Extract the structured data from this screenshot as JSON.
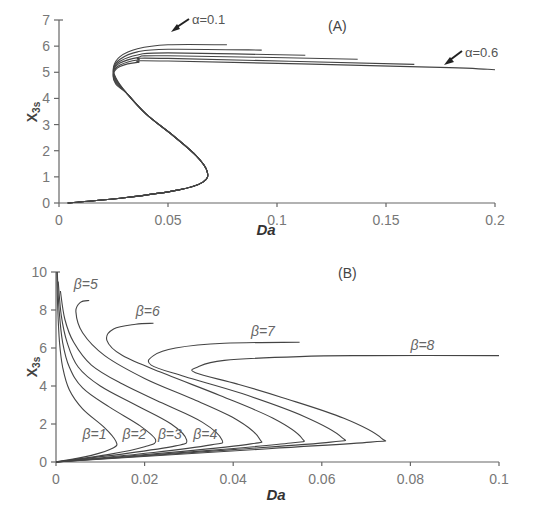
{
  "chart_data": [
    {
      "panel": "(A)",
      "type": "line",
      "title": "",
      "xlabel": "Da",
      "ylabel": "X3s",
      "xlim": [
        0,
        0.2
      ],
      "ylim": [
        0,
        7
      ],
      "xticks": [
        "0",
        "0.05",
        "0.1",
        "0.15",
        "0.2"
      ],
      "yticks": [
        "0",
        "1",
        "2",
        "3",
        "4",
        "5",
        "6",
        "7"
      ],
      "grid": false,
      "annotations": [
        {
          "text": "α=0.1",
          "x": 0.052,
          "y": 6.1
        },
        {
          "text": "α=0.6",
          "x": 0.17,
          "y": 5.2
        }
      ],
      "series": [
        {
          "name": "α=0.1",
          "points": [
            [
              0.004,
              0.0
            ],
            [
              0.03,
              0.2
            ],
            [
              0.055,
              0.5
            ],
            [
              0.066,
              0.8
            ],
            [
              0.068,
              1.2
            ],
            [
              0.063,
              1.8
            ],
            [
              0.052,
              2.6
            ],
            [
              0.04,
              3.4
            ],
            [
              0.031,
              4.2
            ],
            [
              0.026,
              4.8
            ],
            [
              0.025,
              5.2
            ],
            [
              0.028,
              5.6
            ],
            [
              0.036,
              5.9
            ],
            [
              0.05,
              6.05
            ],
            [
              0.077,
              6.05
            ]
          ]
        },
        {
          "name": "α=0.2",
          "points": [
            [
              0.004,
              0.0
            ],
            [
              0.03,
              0.2
            ],
            [
              0.055,
              0.5
            ],
            [
              0.066,
              0.8
            ],
            [
              0.068,
              1.2
            ],
            [
              0.063,
              1.8
            ],
            [
              0.052,
              2.6
            ],
            [
              0.04,
              3.4
            ],
            [
              0.031,
              4.2
            ],
            [
              0.026,
              4.75
            ],
            [
              0.025,
              5.15
            ],
            [
              0.028,
              5.5
            ],
            [
              0.036,
              5.78
            ],
            [
              0.05,
              5.88
            ],
            [
              0.093,
              5.85
            ]
          ]
        },
        {
          "name": "α=0.3",
          "points": [
            [
              0.004,
              0.0
            ],
            [
              0.03,
              0.2
            ],
            [
              0.055,
              0.5
            ],
            [
              0.066,
              0.8
            ],
            [
              0.068,
              1.2
            ],
            [
              0.063,
              1.8
            ],
            [
              0.052,
              2.6
            ],
            [
              0.04,
              3.4
            ],
            [
              0.031,
              4.2
            ],
            [
              0.026,
              4.7
            ],
            [
              0.025,
              5.1
            ],
            [
              0.028,
              5.42
            ],
            [
              0.036,
              5.66
            ],
            [
              0.05,
              5.74
            ],
            [
              0.113,
              5.65
            ]
          ]
        },
        {
          "name": "α=0.4",
          "points": [
            [
              0.004,
              0.0
            ],
            [
              0.03,
              0.2
            ],
            [
              0.055,
              0.5
            ],
            [
              0.066,
              0.8
            ],
            [
              0.068,
              1.2
            ],
            [
              0.063,
              1.8
            ],
            [
              0.052,
              2.6
            ],
            [
              0.04,
              3.4
            ],
            [
              0.031,
              4.2
            ],
            [
              0.026,
              4.65
            ],
            [
              0.025,
              5.05
            ],
            [
              0.028,
              5.35
            ],
            [
              0.036,
              5.56
            ],
            [
              0.05,
              5.63
            ],
            [
              0.137,
              5.5
            ]
          ]
        },
        {
          "name": "α=0.5",
          "points": [
            [
              0.004,
              0.0
            ],
            [
              0.03,
              0.2
            ],
            [
              0.055,
              0.5
            ],
            [
              0.066,
              0.8
            ],
            [
              0.068,
              1.2
            ],
            [
              0.063,
              1.8
            ],
            [
              0.052,
              2.6
            ],
            [
              0.04,
              3.4
            ],
            [
              0.031,
              4.2
            ],
            [
              0.026,
              4.6
            ],
            [
              0.025,
              5.0
            ],
            [
              0.028,
              5.28
            ],
            [
              0.036,
              5.47
            ],
            [
              0.05,
              5.53
            ],
            [
              0.163,
              5.3
            ]
          ]
        },
        {
          "name": "α=0.6",
          "points": [
            [
              0.004,
              0.0
            ],
            [
              0.03,
              0.2
            ],
            [
              0.055,
              0.5
            ],
            [
              0.066,
              0.8
            ],
            [
              0.068,
              1.2
            ],
            [
              0.063,
              1.8
            ],
            [
              0.052,
              2.6
            ],
            [
              0.04,
              3.4
            ],
            [
              0.031,
              4.2
            ],
            [
              0.026,
              4.55
            ],
            [
              0.025,
              4.95
            ],
            [
              0.028,
              5.22
            ],
            [
              0.036,
              5.38
            ],
            [
              0.05,
              5.43
            ],
            [
              0.17,
              5.2
            ],
            [
              0.2,
              5.1
            ]
          ]
        }
      ]
    },
    {
      "panel": "(B)",
      "type": "line",
      "title": "",
      "xlabel": "Da",
      "ylabel": "X3s",
      "xlim": [
        0,
        0.1
      ],
      "ylim": [
        0,
        10
      ],
      "xticks": [
        "0",
        "0.02",
        "0.04",
        "0.06",
        "0.08",
        "0.1"
      ],
      "yticks": [
        "0",
        "2",
        "4",
        "6",
        "8",
        "10"
      ],
      "grid": false,
      "series": [
        {
          "name": "β=1",
          "label_pos": [
            0.006,
            1.2
          ],
          "points": [
            [
              0.0,
              0.0
            ],
            [
              0.008,
              0.35
            ],
            [
              0.013,
              0.75
            ],
            [
              0.0135,
              1.1
            ],
            [
              0.011,
              1.8
            ],
            [
              0.006,
              2.8
            ],
            [
              0.003,
              3.8
            ],
            [
              0.0015,
              5.0
            ],
            [
              0.0008,
              6.3
            ],
            [
              0.0004,
              8.0
            ],
            [
              0.0002,
              10.0
            ]
          ]
        },
        {
          "name": "β=2",
          "label_pos": [
            0.015,
            1.2
          ],
          "points": [
            [
              0.0,
              0.0
            ],
            [
              0.012,
              0.4
            ],
            [
              0.02,
              0.8
            ],
            [
              0.0225,
              1.15
            ],
            [
              0.019,
              1.9
            ],
            [
              0.012,
              2.9
            ],
            [
              0.006,
              3.9
            ],
            [
              0.003,
              5.0
            ],
            [
              0.0015,
              6.3
            ],
            [
              0.0007,
              8.0
            ],
            [
              0.0003,
              10.0
            ]
          ]
        },
        {
          "name": "β=3",
          "label_pos": [
            0.023,
            1.2
          ],
          "points": [
            [
              0.0,
              0.0
            ],
            [
              0.016,
              0.45
            ],
            [
              0.027,
              0.85
            ],
            [
              0.0295,
              1.15
            ],
            [
              0.026,
              2.0
            ],
            [
              0.018,
              3.0
            ],
            [
              0.01,
              4.0
            ],
            [
              0.005,
              5.0
            ],
            [
              0.0025,
              6.3
            ],
            [
              0.0012,
              7.7
            ],
            [
              0.0005,
              9.5
            ]
          ]
        },
        {
          "name": "β=4",
          "label_pos": [
            0.031,
            1.2
          ],
          "points": [
            [
              0.0,
              0.0
            ],
            [
              0.022,
              0.5
            ],
            [
              0.035,
              0.9
            ],
            [
              0.0375,
              1.15
            ],
            [
              0.033,
              2.1
            ],
            [
              0.024,
              3.1
            ],
            [
              0.015,
              4.1
            ],
            [
              0.008,
              5.1
            ],
            [
              0.004,
              6.3
            ],
            [
              0.002,
              7.5
            ],
            [
              0.001,
              9.0
            ]
          ]
        },
        {
          "name": "β=5",
          "label_pos": [
            0.004,
            9.1
          ],
          "points": [
            [
              0.0,
              0.0
            ],
            [
              0.028,
              0.55
            ],
            [
              0.044,
              0.95
            ],
            [
              0.046,
              1.2
            ],
            [
              0.041,
              2.2
            ],
            [
              0.031,
              3.3
            ],
            [
              0.02,
              4.4
            ],
            [
              0.011,
              5.6
            ],
            [
              0.006,
              6.8
            ],
            [
              0.0045,
              7.9
            ],
            [
              0.0055,
              8.4
            ],
            [
              0.0075,
              8.5
            ]
          ]
        },
        {
          "name": "β=6",
          "label_pos": [
            0.018,
            7.7
          ],
          "points": [
            [
              0.0,
              0.0
            ],
            [
              0.034,
              0.6
            ],
            [
              0.053,
              1.0
            ],
            [
              0.0555,
              1.25
            ],
            [
              0.049,
              2.3
            ],
            [
              0.037,
              3.5
            ],
            [
              0.025,
              4.6
            ],
            [
              0.015,
              5.6
            ],
            [
              0.0115,
              6.4
            ],
            [
              0.013,
              7.0
            ],
            [
              0.018,
              7.25
            ],
            [
              0.022,
              7.3
            ]
          ]
        },
        {
          "name": "β=7",
          "label_pos": [
            0.044,
            6.65
          ],
          "points": [
            [
              0.0,
              0.0
            ],
            [
              0.04,
              0.65
            ],
            [
              0.062,
              1.05
            ],
            [
              0.0645,
              1.3
            ],
            [
              0.056,
              2.4
            ],
            [
              0.042,
              3.6
            ],
            [
              0.029,
              4.5
            ],
            [
              0.0215,
              5.1
            ],
            [
              0.022,
              5.6
            ],
            [
              0.027,
              6.0
            ],
            [
              0.038,
              6.25
            ],
            [
              0.055,
              6.3
            ]
          ]
        },
        {
          "name": "β=8",
          "label_pos": [
            0.08,
            5.9
          ],
          "points": [
            [
              0.0,
              0.0
            ],
            [
              0.048,
              0.7
            ],
            [
              0.071,
              1.05
            ],
            [
              0.0735,
              1.25
            ],
            [
              0.065,
              2.3
            ],
            [
              0.051,
              3.4
            ],
            [
              0.041,
              4.1
            ],
            [
              0.0315,
              4.7
            ],
            [
              0.032,
              5.0
            ],
            [
              0.038,
              5.35
            ],
            [
              0.055,
              5.55
            ],
            [
              0.07,
              5.6
            ],
            [
              0.1,
              5.6
            ]
          ]
        }
      ]
    }
  ],
  "labels": {
    "panel_a": "(A)",
    "panel_b": "(B)",
    "xlabel": "Da",
    "ylabel_main": "X",
    "ylabel_sub": "3s",
    "alpha_first": "α=0.1",
    "alpha_last": "α=0.6"
  }
}
